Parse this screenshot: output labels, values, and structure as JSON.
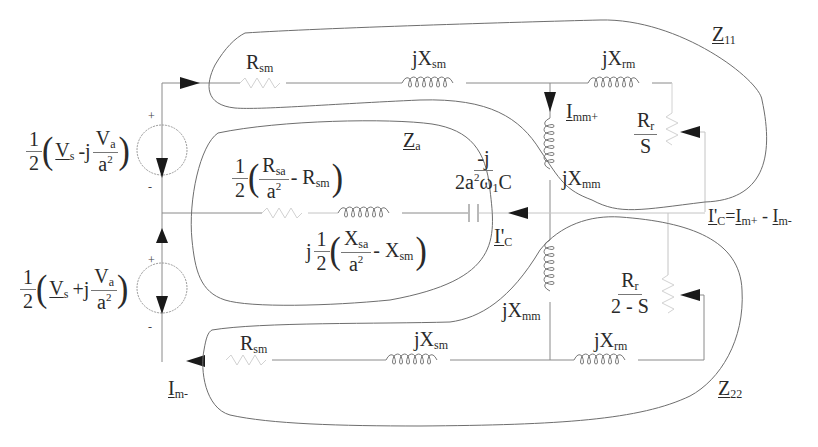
{
  "diagram": {
    "type": "circuit",
    "sources": {
      "upper": {
        "coef_num": "1",
        "coef_den": "2",
        "term1": "V",
        "term1_sub": "s",
        "op": "-j",
        "frac_num": "V",
        "frac_num_sub": "a",
        "frac_den": "a",
        "frac_den_sup": "2",
        "plus": "+",
        "minus": "-"
      },
      "lower": {
        "coef_num": "1",
        "coef_den": "2",
        "term1": "V",
        "term1_sub": "s",
        "op": "+j",
        "frac_num": "V",
        "frac_num_sub": "a",
        "frac_den": "a",
        "frac_den_sup": "2",
        "plus": "+",
        "minus": "-"
      }
    },
    "top_branch": {
      "rsm": {
        "main": "R",
        "sub": "sm"
      },
      "jxsm": {
        "main": "jX",
        "sub": "sm"
      },
      "jxrm": {
        "main": "jX",
        "sub": "rm"
      },
      "jxmm": {
        "main": "jX",
        "sub": "mm"
      },
      "current": {
        "main": "I",
        "sub": "mm+"
      },
      "rotor": {
        "num": "R",
        "num_sub": "r",
        "den": "S"
      },
      "loop_label": {
        "main": "Z",
        "sub": "11"
      }
    },
    "middle_branch": {
      "za_label": {
        "main": "Z",
        "sub": "a"
      },
      "resistor_expr": {
        "coef_num": "1",
        "coef_den": "2",
        "frac_num": "R",
        "frac_num_sub": "sa",
        "frac_den": "a",
        "frac_den_sup": "2",
        "minus_term": "- R",
        "minus_term_sub": "sm"
      },
      "inductor_expr": {
        "prefix": "j",
        "coef_num": "1",
        "coef_den": "2",
        "frac_num": "X",
        "frac_num_sub": "sa",
        "frac_den": "a",
        "frac_den_sup": "2",
        "minus_term": "- X",
        "minus_term_sub": "sm"
      },
      "capacitor_expr": {
        "num": "-j",
        "den_pre": "2a",
        "den_sup": "2",
        "den_mid": "ω",
        "den_sub": "1",
        "den_post": "C"
      },
      "current": {
        "main": "I'",
        "sub": "C"
      },
      "current_relation": {
        "lhs": "I'",
        "lhs_sub": "C",
        "eq": "=",
        "t1": "I",
        "t1_sub": "m+",
        "op": " - ",
        "t2": "I",
        "t2_sub": "m-"
      }
    },
    "bottom_branch": {
      "rsm": {
        "main": "R",
        "sub": "sm"
      },
      "jxsm": {
        "main": "jX",
        "sub": "sm"
      },
      "jxrm": {
        "main": "jX",
        "sub": "rm"
      },
      "jxmm": {
        "main": "jX",
        "sub": "mm"
      },
      "current": {
        "main": "I",
        "sub": "m-"
      },
      "rotor": {
        "num": "R",
        "num_sub": "r",
        "den": "2 - S"
      },
      "loop_label": {
        "main": "Z",
        "sub": "22"
      }
    },
    "colors": {
      "wire": "#8a8a8a",
      "loop": "#6e6e6e",
      "arrow": "#1a1a1a",
      "text": "#2a2a2a"
    }
  }
}
